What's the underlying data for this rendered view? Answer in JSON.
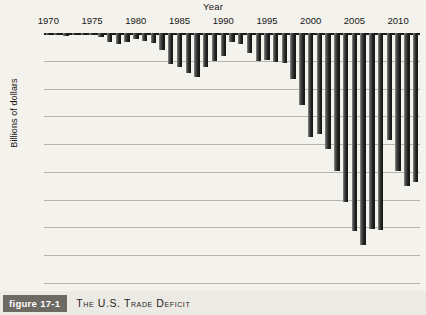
{
  "caption": {
    "badge": "figure 17-1",
    "title": "The U.S. Trade Deficit"
  },
  "chart_data": {
    "type": "bar",
    "title": "The U.S. Trade Deficit",
    "xlabel": "Year",
    "ylabel": "Billions of dollars",
    "ylim": [
      -900,
      0
    ],
    "ytick_labels": [
      "0",
      "−$100",
      "−$200",
      "−$300",
      "−$400",
      "−$500",
      "−$600",
      "−$700",
      "−$800",
      "−$900"
    ],
    "yticks": [
      0,
      -100,
      -200,
      -300,
      -400,
      -500,
      -600,
      -700,
      -800,
      -900
    ],
    "xtick_labels": [
      "1970",
      "1975",
      "1980",
      "1985",
      "1990",
      "1995",
      "2000",
      "2005",
      "2010"
    ],
    "xticks": [
      1970,
      1975,
      1980,
      1985,
      1990,
      1995,
      2000,
      2005,
      2010
    ],
    "grid": true,
    "legend": "none",
    "bar_color": "#242424",
    "categories": [
      1970,
      1971,
      1972,
      1973,
      1974,
      1975,
      1976,
      1977,
      1978,
      1979,
      1980,
      1981,
      1982,
      1983,
      1984,
      1985,
      1986,
      1987,
      1988,
      1989,
      1990,
      1991,
      1992,
      1993,
      1994,
      1995,
      1996,
      1997,
      1998,
      1999,
      2000,
      2001,
      2002,
      2003,
      2004,
      2005,
      2006,
      2007,
      2008,
      2009,
      2010,
      2011,
      2012
    ],
    "values": [
      -3,
      -6,
      -9,
      -4,
      -8,
      -5,
      -14,
      -32,
      -38,
      -34,
      -22,
      -30,
      -36,
      -62,
      -110,
      -122,
      -145,
      -160,
      -121,
      -100,
      -81,
      -31,
      -40,
      -71,
      -99,
      -97,
      -105,
      -109,
      -165,
      -260,
      -373,
      -362,
      -419,
      -495,
      -609,
      -714,
      -762,
      -705,
      -709,
      -384,
      -495,
      -549,
      -535
    ]
  }
}
